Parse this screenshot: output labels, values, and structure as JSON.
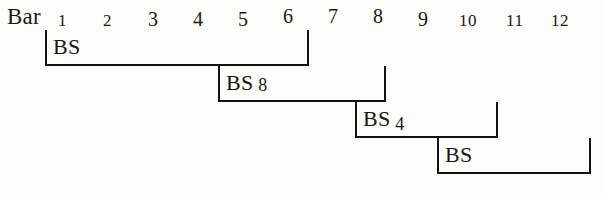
{
  "figure": {
    "kind": "music-form-bracket-diagram",
    "background_color": "#fdfdfb",
    "ink_color": "#16120f"
  },
  "header": {
    "row_label": "Bar",
    "numbers": [
      {
        "label": "1",
        "x": 58
      },
      {
        "label": "2",
        "x": 103
      },
      {
        "label": "3",
        "x": 148
      },
      {
        "label": "4",
        "x": 193
      },
      {
        "label": "5",
        "x": 238
      },
      {
        "label": "6",
        "x": 283
      },
      {
        "label": "7",
        "x": 328
      },
      {
        "label": "8",
        "x": 373
      },
      {
        "label": "9",
        "x": 418
      },
      {
        "label": "10",
        "x": 459
      },
      {
        "label": "11",
        "x": 506
      },
      {
        "label": "12",
        "x": 551
      }
    ]
  },
  "brackets": [
    {
      "id": "bracket-1",
      "label_text": "BS",
      "label_number": "",
      "start_bar": 1,
      "end_bar": 7,
      "left": 45,
      "right": 309,
      "top": 30,
      "bottom": 66,
      "open_right": false
    },
    {
      "id": "bracket-2",
      "label_text": "BS",
      "label_number": "8",
      "start_bar": 5,
      "end_bar": 8,
      "left": 218,
      "right": 386,
      "top": 66,
      "bottom": 102,
      "open_right": false
    },
    {
      "id": "bracket-3",
      "label_text": "BS",
      "label_number": "4",
      "start_bar": 8,
      "end_bar": 11,
      "left": 355,
      "right": 498,
      "top": 102,
      "bottom": 138,
      "open_right": false
    },
    {
      "id": "bracket-4",
      "label_text": "BS",
      "label_number": "",
      "start_bar": 10,
      "end_bar": 12,
      "left": 437,
      "right": 591,
      "top": 138,
      "bottom": 174,
      "open_right": false
    }
  ]
}
